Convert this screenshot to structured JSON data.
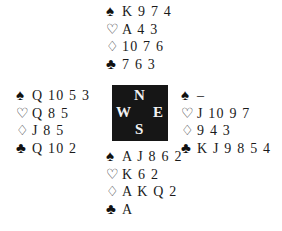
{
  "suit_symbols": {
    "spades": "♠",
    "hearts": "♡",
    "diamonds": "♢",
    "clubs": "♣"
  },
  "compass": {
    "north": "N",
    "south": "S",
    "west": "W",
    "east": "E"
  },
  "hands": {
    "north": {
      "spades": "K 9 7 4",
      "hearts": "A 4 3",
      "diamonds": "10 7 6",
      "clubs": "7 6 3"
    },
    "west": {
      "spades": "Q 10 5 3",
      "hearts": "Q 8 5",
      "diamonds": "J 8 5",
      "clubs": "Q 10 2"
    },
    "east": {
      "spades": "–",
      "hearts": "J 10 9 7",
      "diamonds": "9 4 3",
      "clubs": "K J 9 8 5 4"
    },
    "south": {
      "spades": "A J 8 6 2",
      "hearts": "K 6 2",
      "diamonds": "A K Q 2",
      "clubs": "A"
    }
  }
}
